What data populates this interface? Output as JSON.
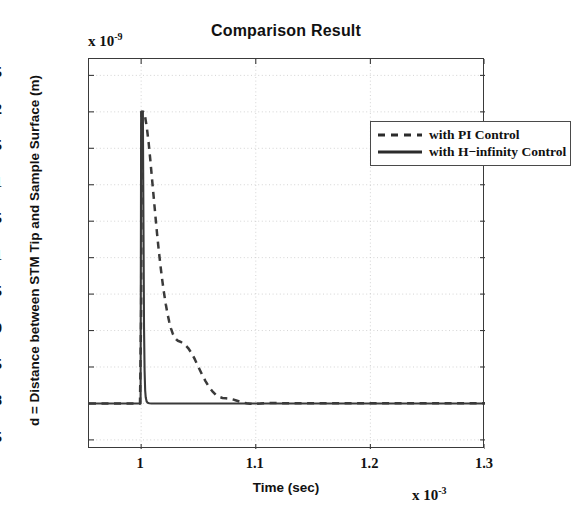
{
  "chart_data": {
    "type": "line",
    "title": "Comparison Result",
    "xlabel": "Time (sec)",
    "ylabel": "d = Distance between STM Tip and Sample Surface (m)",
    "x_exponent_label": "x 10",
    "x_exponent_power": "-3",
    "y_exponent_label": "x 10",
    "y_exponent_power": "-9",
    "xlim": [
      0.9545,
      1.3
    ],
    "ylim": [
      0.7375,
      1.2725
    ],
    "xticks": [
      1,
      1.1,
      1.2,
      1.3
    ],
    "xtick_labels": [
      "1",
      "1.1",
      "1.2",
      "1.3"
    ],
    "yticks": [
      0.75,
      0.8,
      0.85,
      0.9,
      0.95,
      1,
      1.05,
      1.1,
      1.15,
      1.2,
      1.25
    ],
    "ytick_labels": [
      "0.75",
      "0.8",
      "0.85",
      "0.9",
      "0.95",
      "1",
      "1.05",
      "1.1",
      "1.15",
      "1.2",
      "1.25"
    ],
    "grid": true,
    "legend_position": "top-right",
    "series": [
      {
        "name": "with PI Control",
        "style": "dashed",
        "color": "#3a3a3a",
        "points": [
          [
            0.9545,
            0.8
          ],
          [
            0.98,
            0.8
          ],
          [
            0.999,
            0.8
          ],
          [
            1.0,
            0.93
          ],
          [
            1.0005,
            1.2
          ],
          [
            1.002,
            1.2
          ],
          [
            1.0035,
            1.193
          ],
          [
            1.005,
            1.178
          ],
          [
            1.0065,
            1.158
          ],
          [
            1.008,
            1.134
          ],
          [
            1.0095,
            1.108
          ],
          [
            1.011,
            1.082
          ],
          [
            1.0125,
            1.056
          ],
          [
            1.014,
            1.031
          ],
          [
            1.0155,
            1.008
          ],
          [
            1.017,
            0.987
          ],
          [
            1.0185,
            0.968
          ],
          [
            1.02,
            0.951
          ],
          [
            1.0215,
            0.936
          ],
          [
            1.023,
            0.923
          ],
          [
            1.0245,
            0.912
          ],
          [
            1.026,
            0.903
          ],
          [
            1.0275,
            0.896
          ],
          [
            1.029,
            0.891
          ],
          [
            1.0305,
            0.888
          ],
          [
            1.032,
            0.886
          ],
          [
            1.035,
            0.884
          ],
          [
            1.038,
            0.881
          ],
          [
            1.041,
            0.876
          ],
          [
            1.044,
            0.869
          ],
          [
            1.047,
            0.86
          ],
          [
            1.05,
            0.85
          ],
          [
            1.053,
            0.84
          ],
          [
            1.056,
            0.831
          ],
          [
            1.059,
            0.823
          ],
          [
            1.062,
            0.817
          ],
          [
            1.065,
            0.812
          ],
          [
            1.068,
            0.809
          ],
          [
            1.071,
            0.8075
          ],
          [
            1.074,
            0.807
          ],
          [
            1.077,
            0.8065
          ],
          [
            1.08,
            0.8055
          ],
          [
            1.083,
            0.804
          ],
          [
            1.086,
            0.8025
          ],
          [
            1.089,
            0.8012
          ],
          [
            1.092,
            0.8002
          ],
          [
            1.095,
            0.7996
          ],
          [
            1.098,
            0.7994
          ],
          [
            1.101,
            0.7995
          ],
          [
            1.104,
            0.7998
          ],
          [
            1.107,
            0.8002
          ],
          [
            1.11,
            0.8004
          ],
          [
            1.115,
            0.8005
          ],
          [
            1.12,
            0.8004
          ],
          [
            1.13,
            0.8003
          ],
          [
            1.15,
            0.8002
          ],
          [
            1.18,
            0.8002
          ],
          [
            1.22,
            0.8002
          ],
          [
            1.26,
            0.8002
          ],
          [
            1.3,
            0.8002
          ]
        ]
      },
      {
        "name": "with H−infinity Control",
        "style": "solid",
        "color": "#3a3a3a",
        "points": [
          [
            0.9545,
            0.8
          ],
          [
            0.99,
            0.8
          ],
          [
            0.9995,
            0.8
          ],
          [
            1.0,
            1.2
          ],
          [
            1.0015,
            1.2
          ],
          [
            1.002,
            1.05
          ],
          [
            1.0025,
            0.905
          ],
          [
            1.003,
            0.845
          ],
          [
            1.0035,
            0.818
          ],
          [
            1.004,
            0.808
          ],
          [
            1.0048,
            0.8026
          ],
          [
            1.0058,
            0.8008
          ],
          [
            1.007,
            0.8002
          ],
          [
            1.009,
            0.8
          ],
          [
            1.012,
            0.8
          ],
          [
            1.02,
            0.8
          ],
          [
            1.05,
            0.8
          ],
          [
            1.1,
            0.8
          ],
          [
            1.15,
            0.8
          ],
          [
            1.2,
            0.8
          ],
          [
            1.25,
            0.8
          ],
          [
            1.3,
            0.8
          ]
        ]
      }
    ]
  },
  "legend": {
    "items": [
      {
        "label": "with PI Control",
        "style": "dashed"
      },
      {
        "label": "with H−infinity Control",
        "style": "solid"
      }
    ]
  }
}
